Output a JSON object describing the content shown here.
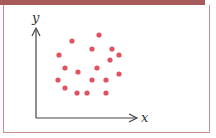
{
  "chart_data": {
    "type": "scatter",
    "title": "",
    "xlabel": "x",
    "ylabel": "y",
    "grid": false,
    "legend": null,
    "point_color": "#e0525f",
    "points": [
      {
        "x": 99,
        "y": 35
      },
      {
        "x": 72,
        "y": 41
      },
      {
        "x": 92,
        "y": 49
      },
      {
        "x": 112,
        "y": 49
      },
      {
        "x": 59,
        "y": 55
      },
      {
        "x": 119,
        "y": 55
      },
      {
        "x": 110,
        "y": 60
      },
      {
        "x": 65,
        "y": 68
      },
      {
        "x": 78,
        "y": 72
      },
      {
        "x": 97,
        "y": 68
      },
      {
        "x": 119,
        "y": 74
      },
      {
        "x": 58,
        "y": 80
      },
      {
        "x": 92,
        "y": 80
      },
      {
        "x": 106,
        "y": 80
      },
      {
        "x": 65,
        "y": 88
      },
      {
        "x": 77,
        "y": 93
      },
      {
        "x": 87,
        "y": 93
      },
      {
        "x": 106,
        "y": 93
      }
    ]
  },
  "axes": {
    "x_label": "x",
    "y_label": "y"
  },
  "colors": {
    "frame": "#c98e94",
    "topbar": "#a65a5a",
    "axis": "#444444",
    "points": "#e0525f"
  }
}
